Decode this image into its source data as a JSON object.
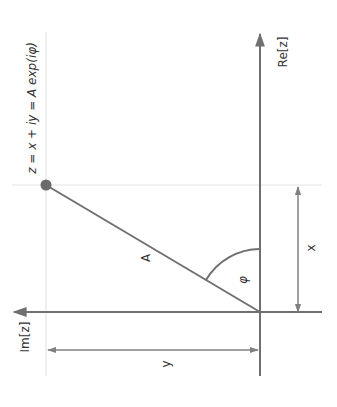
{
  "diagram": {
    "formula": "z = x + iy = A exp(iφ)",
    "axes": {
      "real_label": "Re[z]",
      "imag_label": "Im[z]"
    },
    "labels": {
      "magnitude": "A",
      "angle": "φ",
      "x_dimension": "x",
      "y_dimension": "y"
    },
    "colors": {
      "axis": "#707070",
      "grid": "#e0e0e0",
      "point": "#6a6a6a",
      "text": "#333333"
    }
  }
}
